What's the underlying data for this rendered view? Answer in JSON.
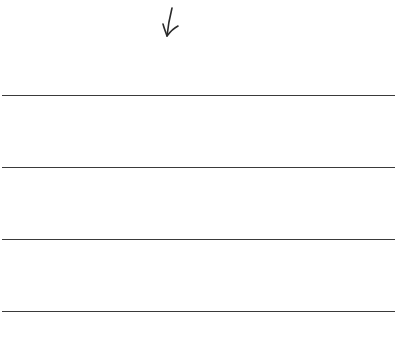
{
  "arrow": {
    "icon": "down-arrow-icon",
    "color": "#2a2a2a"
  },
  "lines": [
    {
      "y": 95
    },
    {
      "y": 167
    },
    {
      "y": 239
    },
    {
      "y": 311
    }
  ],
  "line_color": "#3a3a3a"
}
